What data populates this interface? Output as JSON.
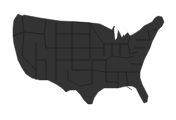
{
  "map": {
    "subject": "contiguous-united-states",
    "style": "silhouette-with-state-borders",
    "colors": {
      "background": "#ffffff",
      "land": "#333333",
      "borders": "#1a1a1a"
    }
  }
}
